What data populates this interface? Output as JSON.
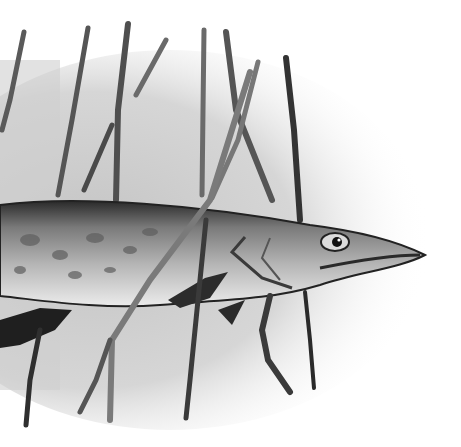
{
  "image": {
    "description": "Grayscale watercolor illustration of a pike fish swimming left-to-right among reed stalks",
    "subject": "pike",
    "palette": {
      "background": "#ffffff",
      "wash": "#c9c9c9",
      "wash_light": "#e2e2e2",
      "dark": "#1e1e1e",
      "mid": "#6f6f6f",
      "belly": "#e8e8e8"
    }
  }
}
